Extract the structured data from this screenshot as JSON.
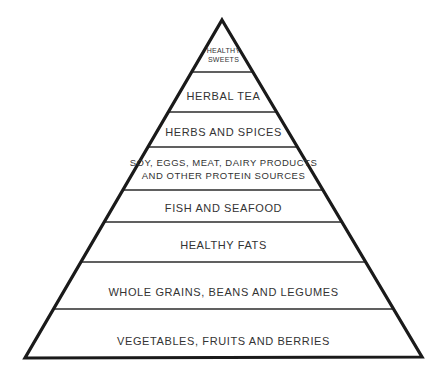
{
  "figure": {
    "name": "healthy-eating-food-pyramid",
    "background_color": "#ffffff",
    "outline_color": "#1a1a1a",
    "divider_color": "#2b2b2b",
    "text_color": "#333333",
    "apex": {
      "x": 222,
      "y": 20
    },
    "base_left": {
      "x": 25,
      "y": 358
    },
    "base_right": {
      "x": 422,
      "y": 357
    }
  },
  "tiers": [
    {
      "id": "healthy-sweets",
      "label": "Healthy\nSweets",
      "size": "apex",
      "top_y": 20,
      "bottom_y": 72,
      "center_y": 55
    },
    {
      "id": "herbal-tea",
      "label": "Herbal Tea",
      "size": "normal",
      "top_y": 72,
      "bottom_y": 112,
      "center_y": 96
    },
    {
      "id": "herbs-and-spices",
      "label": "Herbs and Spices",
      "size": "normal",
      "top_y": 112,
      "bottom_y": 147,
      "center_y": 132
    },
    {
      "id": "protein-sources",
      "label": "Soy, eggs, meat, dairy products\nand other protein sources",
      "size": "small",
      "top_y": 147,
      "bottom_y": 190,
      "center_y": 170
    },
    {
      "id": "fish-and-seafood",
      "label": "Fish and Seafood",
      "size": "normal",
      "top_y": 190,
      "bottom_y": 222,
      "center_y": 208
    },
    {
      "id": "healthy-fats",
      "label": "Healthy Fats",
      "size": "normal",
      "top_y": 222,
      "bottom_y": 262,
      "center_y": 245
    },
    {
      "id": "whole-grains-beans-legumes",
      "label": "Whole Grains, Beans and Legumes",
      "size": "normal",
      "top_y": 262,
      "bottom_y": 309,
      "center_y": 292
    },
    {
      "id": "vegetables-fruits-berries",
      "label": "Vegetables, Fruits and Berries",
      "size": "normal",
      "top_y": 309,
      "bottom_y": 358,
      "center_y": 341
    }
  ]
}
